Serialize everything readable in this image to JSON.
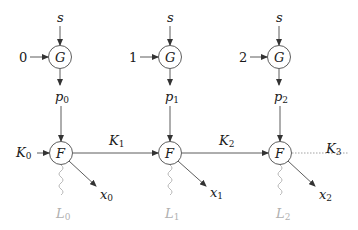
{
  "diagram": {
    "type": "computation graph",
    "colors": {
      "stroke": "#333333",
      "faint": "#b0b0b0",
      "background": "#ffffff"
    },
    "columns": [
      {
        "input_value": "0",
        "s_label": "s",
        "g_node": "G",
        "p_label": "p",
        "p_sub": "0",
        "f_node": "F",
        "k_in_label": "K",
        "k_in_sub": "0",
        "k_out_label": "K",
        "k_out_sub": "1",
        "x_label": "x",
        "x_sub": "0",
        "l_label": "L",
        "l_sub": "0"
      },
      {
        "input_value": "1",
        "s_label": "s",
        "g_node": "G",
        "p_label": "p",
        "p_sub": "1",
        "f_node": "F",
        "k_out_label": "K",
        "k_out_sub": "2",
        "x_label": "x",
        "x_sub": "1",
        "l_label": "L",
        "l_sub": "1"
      },
      {
        "input_value": "2",
        "s_label": "s",
        "g_node": "G",
        "p_label": "p",
        "p_sub": "2",
        "f_node": "F",
        "k_out_label": "K",
        "k_out_sub": "3",
        "x_label": "x",
        "x_sub": "2",
        "l_label": "L",
        "l_sub": "2"
      }
    ]
  }
}
